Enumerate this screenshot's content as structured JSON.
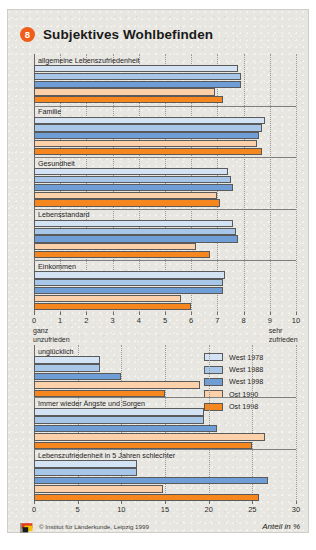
{
  "header": {
    "badge": "8",
    "title": "Subjektives Wohlbefinden"
  },
  "footer": {
    "copyright": "© Institut für Länderkunde, Leipzig 1999",
    "unit_note": "Anteil in %",
    "logo_icon": "ifl-flag-logo"
  },
  "legend": {
    "position": "middle-right",
    "entries": [
      {
        "label": "West 1978",
        "color": "#d3e3f3"
      },
      {
        "label": "West 1988",
        "color": "#a8c6e8"
      },
      {
        "label": "West 1998",
        "color": "#6f9ed6"
      },
      {
        "label": "Ost 1990",
        "color": "#fcd0a8"
      },
      {
        "label": "Ost 1998",
        "color": "#f6871f"
      }
    ]
  },
  "chart_data": [
    {
      "type": "bar",
      "orientation": "horizontal",
      "title": "Subjektives Wohlbefinden",
      "xlabel": "",
      "ylabel": "",
      "xlim": [
        0,
        10
      ],
      "xticks": [
        0,
        1,
        2,
        3,
        4,
        5,
        6,
        7,
        8,
        9,
        10
      ],
      "xticklabels": [
        "0",
        "1",
        "2",
        "3",
        "4",
        "5",
        "6",
        "7",
        "8",
        "9",
        "10"
      ],
      "grid": true,
      "axis_notes": [
        {
          "at": 0,
          "text": "ganz\nunzufrieden",
          "line1": "ganz",
          "line2": "unzufrieden"
        },
        {
          "at": 9,
          "text": "sehr\nzufrieden",
          "line1": "sehr",
          "line2": "zufrieden"
        }
      ],
      "categories": [
        "allgemeine Lebenszufriedenheit",
        "Familie",
        "Gesundheit",
        "Lebensstandard",
        "Einkommen"
      ],
      "series": [
        {
          "name": "West 1978",
          "color": "#d3e3f3",
          "values": [
            7.8,
            8.8,
            7.4,
            7.6,
            7.3
          ]
        },
        {
          "name": "West 1988",
          "color": "#a8c6e8",
          "values": [
            7.9,
            8.7,
            7.5,
            7.7,
            7.2
          ]
        },
        {
          "name": "West 1998",
          "color": "#6f9ed6",
          "values": [
            7.9,
            8.6,
            7.6,
            7.8,
            7.2
          ]
        },
        {
          "name": "Ost 1990",
          "color": "#fcd0a8",
          "values": [
            6.9,
            8.5,
            7.0,
            6.2,
            5.6
          ]
        },
        {
          "name": "Ost 1998",
          "color": "#f6871f",
          "values": [
            7.2,
            8.7,
            7.1,
            6.7,
            6.0
          ]
        }
      ]
    },
    {
      "type": "bar",
      "orientation": "horizontal",
      "title": "",
      "xlabel": "Anteil in %",
      "ylabel": "",
      "xlim": [
        0,
        30
      ],
      "xticks": [
        0,
        5,
        10,
        15,
        20,
        25,
        30
      ],
      "xticklabels": [
        "0",
        "5",
        "10",
        "15",
        "20",
        "25",
        "30"
      ],
      "grid": true,
      "categories": [
        "unglücklich",
        "Immer wieder Ängste und Sorgen",
        "Lebenszufriedenheit in 5 Jahren schlechter"
      ],
      "series": [
        {
          "name": "West 1978",
          "color": "#d3e3f3",
          "values": [
            7.5,
            19.5,
            11.8
          ]
        },
        {
          "name": "West 1988",
          "color": "#a8c6e8",
          "values": [
            7.5,
            19.5,
            11.8
          ]
        },
        {
          "name": "West 1998",
          "color": "#6f9ed6",
          "values": [
            10.0,
            21.0,
            26.8
          ]
        },
        {
          "name": "Ost 1990",
          "color": "#fcd0a8",
          "values": [
            19.0,
            26.5,
            14.8
          ]
        },
        {
          "name": "Ost 1998",
          "color": "#f6871f",
          "values": [
            15.0,
            25.0,
            25.8
          ]
        }
      ]
    }
  ]
}
